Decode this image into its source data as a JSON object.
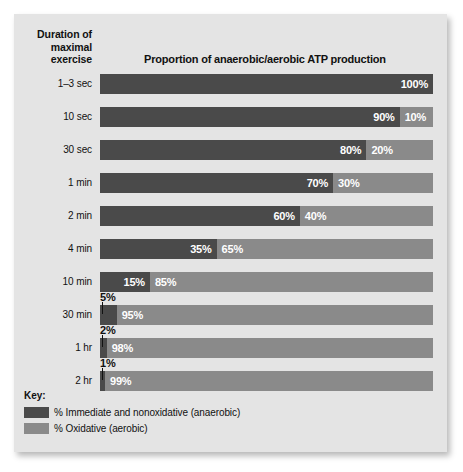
{
  "figure": {
    "row_header": "Duration of\nmaximal\nexercise",
    "title": "Proportion of anaerobic/aerobic ATP production",
    "legend_title": "Key:",
    "colors": {
      "anaerobic": "#4a4a4a",
      "aerobic": "#8a8a8a",
      "panel_background": "#e4e4e4",
      "text": "#111111",
      "value_text": "#ffffff"
    }
  },
  "legend": {
    "items": [
      {
        "label": "% Immediate and nonoxidative (anaerobic)",
        "color": "#4a4a4a",
        "swatch_name": "legend-swatch-anaerobic"
      },
      {
        "label": "% Oxidative (aerobic)",
        "color": "#8a8a8a",
        "swatch_name": "legend-swatch-aerobic"
      }
    ]
  },
  "chart_data": {
    "type": "bar",
    "orientation": "horizontal",
    "stacked": true,
    "normalized": true,
    "title": "Proportion of anaerobic/aerobic ATP production",
    "xlabel": "",
    "ylabel": "Duration of maximal exercise",
    "xlim": [
      0,
      100
    ],
    "grid": false,
    "legend_position": "bottom-left",
    "categories": [
      "1–3 sec",
      "10 sec",
      "30 sec",
      "1 min",
      "2 min",
      "4 min",
      "10 min",
      "30 min",
      "1 hr",
      "2 hr"
    ],
    "series": [
      {
        "name": "% Immediate and nonoxidative (anaerobic)",
        "color": "#4a4a4a",
        "values": [
          100,
          90,
          80,
          70,
          60,
          35,
          15,
          5,
          2,
          1
        ]
      },
      {
        "name": "% Oxidative (aerobic)",
        "color": "#8a8a8a",
        "values": [
          0,
          10,
          20,
          30,
          40,
          65,
          85,
          95,
          98,
          99
        ]
      }
    ],
    "rows": [
      {
        "category": "1–3 sec",
        "anaerobic": 100,
        "aerobic": 0,
        "anaerobic_label": "100%",
        "aerobic_label": "",
        "callout": null
      },
      {
        "category": "10 sec",
        "anaerobic": 90,
        "aerobic": 10,
        "anaerobic_label": "90%",
        "aerobic_label": "10%",
        "callout": null
      },
      {
        "category": "30 sec",
        "anaerobic": 80,
        "aerobic": 20,
        "anaerobic_label": "80%",
        "aerobic_label": "20%",
        "callout": null
      },
      {
        "category": "1 min",
        "anaerobic": 70,
        "aerobic": 30,
        "anaerobic_label": "70%",
        "aerobic_label": "30%",
        "callout": null
      },
      {
        "category": "2 min",
        "anaerobic": 60,
        "aerobic": 40,
        "anaerobic_label": "60%",
        "aerobic_label": "40%",
        "callout": null
      },
      {
        "category": "4 min",
        "anaerobic": 35,
        "aerobic": 65,
        "anaerobic_label": "35%",
        "aerobic_label": "65%",
        "callout": null
      },
      {
        "category": "10 min",
        "anaerobic": 15,
        "aerobic": 85,
        "anaerobic_label": "15%",
        "aerobic_label": "85%",
        "callout": null
      },
      {
        "category": "30 min",
        "anaerobic": 5,
        "aerobic": 95,
        "anaerobic_label": "",
        "aerobic_label": "95%",
        "callout": "5%"
      },
      {
        "category": "1 hr",
        "anaerobic": 2,
        "aerobic": 98,
        "anaerobic_label": "",
        "aerobic_label": "98%",
        "callout": "2%"
      },
      {
        "category": "2 hr",
        "anaerobic": 1,
        "aerobic": 99,
        "anaerobic_label": "",
        "aerobic_label": "99%",
        "callout": "1%"
      }
    ]
  }
}
